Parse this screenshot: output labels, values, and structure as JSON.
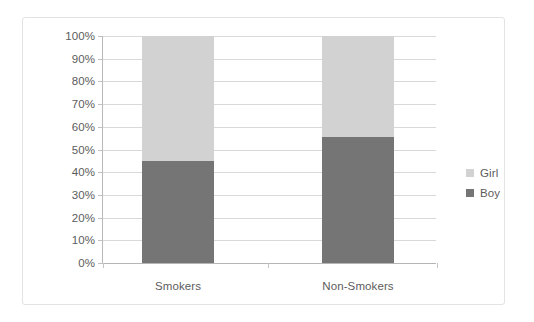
{
  "chart_data": {
    "type": "bar",
    "subtype": "stacked-100-percent",
    "title": "",
    "xlabel": "",
    "ylabel": "",
    "categories": [
      "Smokers",
      "Non-Smokers"
    ],
    "series": [
      {
        "name": "Boy",
        "color": "#757575",
        "values": [
          45,
          55.5
        ]
      },
      {
        "name": "Girl",
        "color": "#d2d2d2",
        "values": [
          55,
          44.5
        ]
      }
    ],
    "stack_order_bottom_to_top": [
      "Boy",
      "Girl"
    ],
    "ylim": [
      0,
      100
    ],
    "y_tick_labels": [
      "100%",
      "90%",
      "80%",
      "70%",
      "60%",
      "50%",
      "40%",
      "30%",
      "20%",
      "10%",
      "0%"
    ],
    "y_tick_values": [
      100,
      90,
      80,
      70,
      60,
      50,
      40,
      30,
      20,
      10,
      0
    ],
    "grid": true,
    "grid_axis": "y",
    "legend": [
      "Girl",
      "Boy"
    ],
    "legend_position": "right",
    "units": "percent"
  },
  "legend": {
    "items": [
      {
        "label": "Girl",
        "color": "#d2d2d2"
      },
      {
        "label": "Boy",
        "color": "#757575"
      }
    ]
  },
  "colors": {
    "girl": "#d2d2d2",
    "boy": "#757575",
    "gridline": "#d9d9d9",
    "axis": "#b8b8b8",
    "frame": "#e3e3e3",
    "text": "#5c5c5c",
    "background": "#ffffff"
  }
}
